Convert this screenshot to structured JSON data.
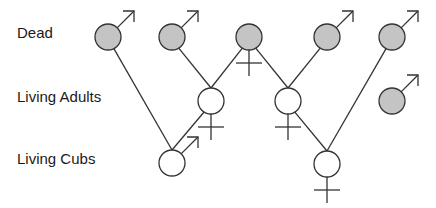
{
  "labels": {
    "dead": "Dead",
    "living_adults": "Living Adults",
    "living_cubs": "Living Cubs"
  },
  "colors": {
    "dead_fill": "#c4c4c4",
    "living_fill": "#ffffff",
    "stroke": "#333333"
  },
  "nodes": [
    {
      "id": "d1",
      "status": "dead",
      "sex": "male",
      "x": 108,
      "y": 37
    },
    {
      "id": "d2",
      "status": "dead",
      "sex": "male",
      "x": 172,
      "y": 37
    },
    {
      "id": "d3",
      "status": "dead",
      "sex": "female",
      "x": 249,
      "y": 37
    },
    {
      "id": "d4",
      "status": "dead",
      "sex": "male",
      "x": 327,
      "y": 37
    },
    {
      "id": "d5",
      "status": "dead",
      "sex": "male",
      "x": 392,
      "y": 37
    },
    {
      "id": "a1",
      "status": "living_adult",
      "sex": "female",
      "x": 211,
      "y": 101
    },
    {
      "id": "a2",
      "status": "living_adult",
      "sex": "female",
      "x": 288,
      "y": 101
    },
    {
      "id": "a3",
      "status": "dead",
      "sex": "male",
      "x": 392,
      "y": 101
    },
    {
      "id": "c1",
      "status": "living_cub",
      "sex": "male",
      "x": 172,
      "y": 163
    },
    {
      "id": "c2",
      "status": "living_cub",
      "sex": "female",
      "x": 327,
      "y": 164
    }
  ],
  "edges": [
    [
      "d1",
      "c1"
    ],
    [
      "d2",
      "a1"
    ],
    [
      "a1",
      "c1"
    ],
    [
      "d3",
      "a1"
    ],
    [
      "d3",
      "a2"
    ],
    [
      "d4",
      "a2"
    ],
    [
      "a2",
      "c2"
    ],
    [
      "d5",
      "c2"
    ]
  ]
}
